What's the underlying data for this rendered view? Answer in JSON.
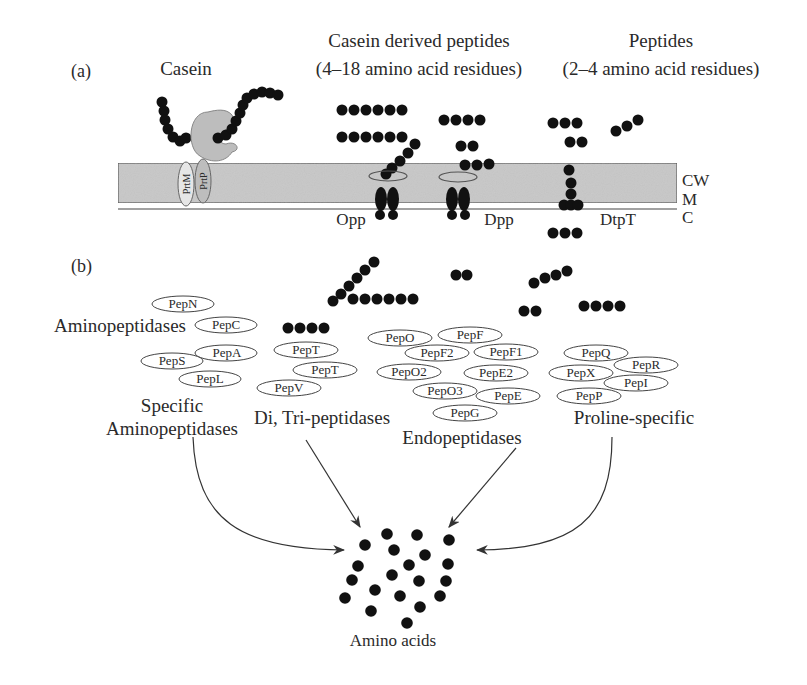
{
  "figure": {
    "panel_a_label": "(a)",
    "panel_b_label": "(b)",
    "colors": {
      "membrane_fill": "#c8c8c8",
      "membrane_stroke": "#555555",
      "residue": "#111111",
      "enzyme_fill": "#bdbdbd",
      "text": "#2a2a2a",
      "ellipse_stroke": "#444444"
    }
  },
  "panel_a": {
    "headers": {
      "casein": "Casein",
      "derived_line1": "Casein derived peptides",
      "derived_line2": "(4–18 amino acid residues)",
      "peptides_line1": "Peptides",
      "peptides_line2": "(2–4 amino acid residues)"
    },
    "proteinase": {
      "prtm": "PrtM",
      "prtp": "PrtP"
    },
    "transporters": {
      "opp": "Opp",
      "dpp": "Dpp",
      "dtpt": "DtpT"
    },
    "layers": {
      "cw": "CW",
      "m": "M",
      "c": "C"
    }
  },
  "panel_b": {
    "groups": [
      {
        "id": "aminopeptidases",
        "label": "Aminopeptidases",
        "enzymes": [
          "PepN",
          "PepC"
        ]
      },
      {
        "id": "specific-aminopeptidases",
        "label_line1": "Specific",
        "label_line2": "Aminopeptidases",
        "enzymes": [
          "PepS",
          "PepA",
          "PepL"
        ]
      },
      {
        "id": "di-tri-peptidases",
        "label": "Di, Tri-peptidases",
        "enzymes": [
          "PepT",
          "PepT",
          "PepV"
        ]
      },
      {
        "id": "endopeptidases",
        "label": "Endopeptidases",
        "enzymes": [
          "PepO",
          "PepF",
          "PepF2",
          "PepF1",
          "PepO2",
          "PepE2",
          "PepO3",
          "PepE",
          "PepG"
        ]
      },
      {
        "id": "proline-specific",
        "label": "Proline-specific",
        "enzymes": [
          "PepQ",
          "PepR",
          "PepX",
          "PepI",
          "PepP"
        ]
      }
    ],
    "product_label": "Amino acids"
  }
}
